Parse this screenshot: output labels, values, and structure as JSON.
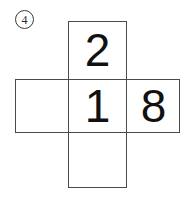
{
  "figure": {
    "item_label": "4",
    "item_label_style": "circled",
    "kind": "cube-net-cross",
    "background_color": "#ffffff",
    "line_color": "#4a4a4a",
    "glyph_color": "#111111",
    "columns": 3,
    "rows": 3,
    "cell_size_px": 59,
    "faces": [
      {
        "id": "face-top",
        "row": 0,
        "col": 1,
        "value": "2",
        "empty": false
      },
      {
        "id": "face-middle-left",
        "row": 1,
        "col": 0,
        "value": "",
        "empty": true
      },
      {
        "id": "face-middle-center",
        "row": 1,
        "col": 1,
        "value": "1",
        "empty": false
      },
      {
        "id": "face-middle-right",
        "row": 1,
        "col": 2,
        "value": "8",
        "empty": false
      },
      {
        "id": "face-bottom",
        "row": 2,
        "col": 1,
        "value": "",
        "empty": true
      }
    ]
  }
}
